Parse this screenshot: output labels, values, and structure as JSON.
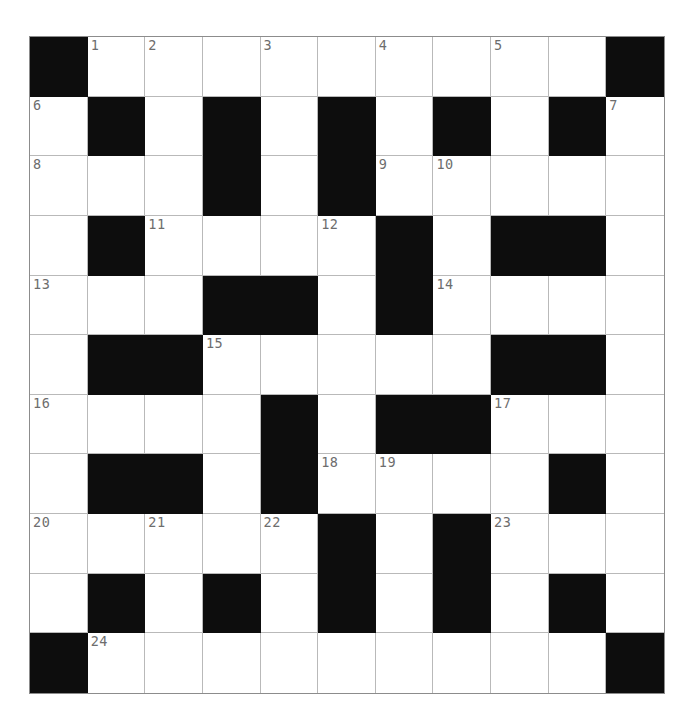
{
  "puzzle": {
    "type": "crossword-grid",
    "rows": 11,
    "cols": 11,
    "cell_size_px": 57.8,
    "grid_origin_px": {
      "x": 29,
      "y": 36
    },
    "colors": {
      "page_background": "#ffffff",
      "cell_fill": "#ffffff",
      "block_fill": "#0d0d0d",
      "grid_line": "#b9b9b9",
      "outer_border": "#8c8c8c",
      "clue_number": "#6d6d6d"
    },
    "legend": {
      "block_symbol": "#",
      "open_symbol": "."
    },
    "layout_rows": [
      "#.........#",
      ".#.#.#.#.#.",
      "...#.#.....",
      ".#....#.##.",
      "...##.#....",
      ".##.....##.",
      "....#.##...",
      ".##.#....#.",
      ".....#.#...",
      ".#.#.#.#.#.",
      "#.........#"
    ],
    "numbered_cells": [
      {
        "number": "1",
        "row": 0,
        "col": 1
      },
      {
        "number": "2",
        "row": 0,
        "col": 2
      },
      {
        "number": "3",
        "row": 0,
        "col": 4
      },
      {
        "number": "4",
        "row": 0,
        "col": 6
      },
      {
        "number": "5",
        "row": 0,
        "col": 8
      },
      {
        "number": "6",
        "row": 1,
        "col": 0
      },
      {
        "number": "7",
        "row": 1,
        "col": 10
      },
      {
        "number": "8",
        "row": 2,
        "col": 0
      },
      {
        "number": "9",
        "row": 2,
        "col": 6
      },
      {
        "number": "10",
        "row": 2,
        "col": 7
      },
      {
        "number": "11",
        "row": 3,
        "col": 2
      },
      {
        "number": "12",
        "row": 3,
        "col": 5
      },
      {
        "number": "13",
        "row": 4,
        "col": 0
      },
      {
        "number": "14",
        "row": 4,
        "col": 7
      },
      {
        "number": "15",
        "row": 5,
        "col": 3
      },
      {
        "number": "16",
        "row": 6,
        "col": 0
      },
      {
        "number": "17",
        "row": 6,
        "col": 8
      },
      {
        "number": "18",
        "row": 7,
        "col": 5
      },
      {
        "number": "19",
        "row": 7,
        "col": 6
      },
      {
        "number": "20",
        "row": 8,
        "col": 0
      },
      {
        "number": "21",
        "row": 8,
        "col": 2
      },
      {
        "number": "22",
        "row": 8,
        "col": 4
      },
      {
        "number": "23",
        "row": 8,
        "col": 8
      },
      {
        "number": "24",
        "row": 10,
        "col": 1
      }
    ],
    "entered_letters": []
  }
}
